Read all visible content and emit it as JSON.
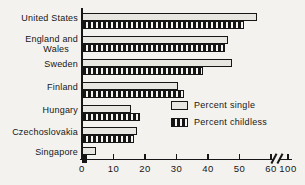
{
  "figure": {
    "background": "#f3f2ee",
    "ink": "#161616",
    "single_bar_fill": "#e8e6e0"
  },
  "chart_data": {
    "type": "bar",
    "orientation": "horizontal",
    "title": "",
    "xlabel": "",
    "ylabel": "",
    "grid": false,
    "categories": [
      "United States",
      "England and Wales",
      "Sweden",
      "Finland",
      "Hungary",
      "Czechoslovakia",
      "Singapore"
    ],
    "category_label_lines": [
      [
        "United States"
      ],
      [
        "England and",
        "Wales"
      ],
      [
        "Sweden"
      ],
      [
        "Finland"
      ],
      [
        "Hungary"
      ],
      [
        "Czechoslovakia"
      ],
      [
        "Singapore"
      ]
    ],
    "series": [
      {
        "name": "Percent single",
        "style": "light-gray-fill",
        "values": [
          55,
          46,
          47,
          30,
          15,
          17,
          4
        ]
      },
      {
        "name": "Percent childless",
        "style": "vertical-hatch",
        "values": [
          51,
          45,
          38,
          32,
          18,
          16,
          1
        ]
      }
    ],
    "x_ticks": [
      0,
      10,
      20,
      30,
      40,
      50,
      60,
      100
    ],
    "axis_break_between": [
      60,
      100
    ],
    "xlim": [
      0,
      60
    ],
    "legend_position": "inside-middle-right"
  },
  "legend": {
    "single": "Percent single",
    "childless": "Percent childless"
  }
}
